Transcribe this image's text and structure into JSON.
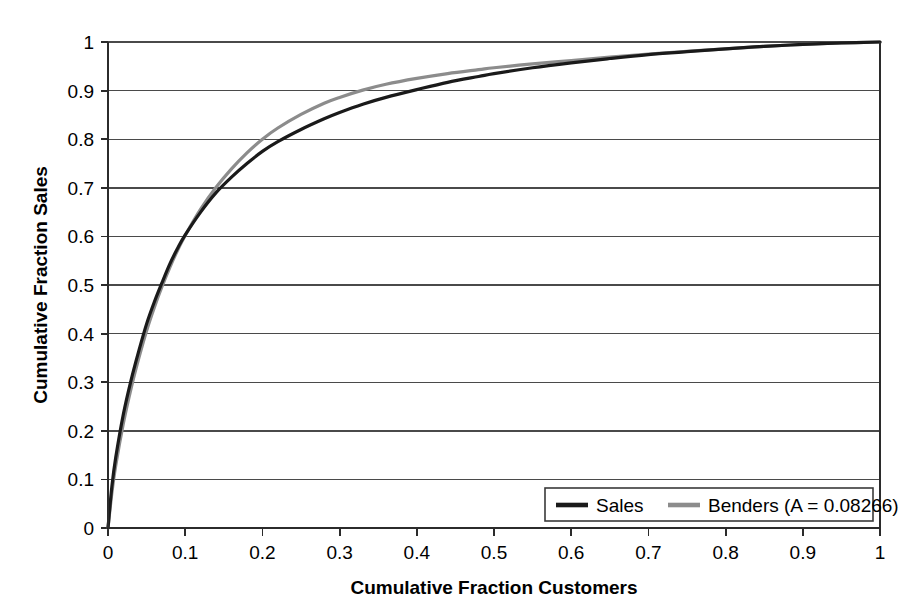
{
  "chart_data": {
    "type": "line",
    "title": "",
    "xlabel": "Cumulative Fraction Customers",
    "ylabel": "Cumulative Fraction Sales",
    "xlim": [
      0,
      1
    ],
    "ylim": [
      0,
      1
    ],
    "grid": "horizontal",
    "legend_position": "bottom-right",
    "x_ticks": [
      "0",
      "0.1",
      "0.2",
      "0.3",
      "0.4",
      "0.5",
      "0.6",
      "0.7",
      "0.8",
      "0.9",
      "1"
    ],
    "y_ticks": [
      "0",
      "0.1",
      "0.2",
      "0.3",
      "0.4",
      "0.5",
      "0.6",
      "0.7",
      "0.8",
      "0.9",
      "1"
    ],
    "x_tick_values": [
      0,
      0.1,
      0.2,
      0.3,
      0.4,
      0.5,
      0.6,
      0.7,
      0.8,
      0.9,
      1
    ],
    "y_tick_values": [
      0,
      0.1,
      0.2,
      0.3,
      0.4,
      0.5,
      0.6,
      0.7,
      0.8,
      0.9,
      1
    ],
    "series": [
      {
        "name": "Sales",
        "color": "#1a1a1a",
        "width": 3.2,
        "x": [
          0,
          0.005,
          0.01,
          0.02,
          0.03,
          0.04,
          0.05,
          0.06,
          0.07,
          0.08,
          0.09,
          0.1,
          0.12,
          0.14,
          0.16,
          0.18,
          0.2,
          0.22,
          0.25,
          0.28,
          0.3,
          0.33,
          0.36,
          0.4,
          0.44,
          0.48,
          0.5,
          0.55,
          0.6,
          0.65,
          0.7,
          0.75,
          0.8,
          0.85,
          0.9,
          0.95,
          1.0
        ],
        "y": [
          0,
          0.085,
          0.145,
          0.235,
          0.305,
          0.365,
          0.42,
          0.465,
          0.505,
          0.543,
          0.575,
          0.603,
          0.65,
          0.69,
          0.722,
          0.75,
          0.775,
          0.795,
          0.82,
          0.842,
          0.855,
          0.872,
          0.886,
          0.902,
          0.917,
          0.929,
          0.935,
          0.947,
          0.957,
          0.966,
          0.974,
          0.98,
          0.986,
          0.991,
          0.995,
          0.998,
          1.0
        ]
      },
      {
        "name": "Benders (A = 0.08266)",
        "color": "#8c8c8c",
        "width": 3.2,
        "x": [
          0,
          0.005,
          0.01,
          0.02,
          0.03,
          0.04,
          0.05,
          0.06,
          0.07,
          0.08,
          0.09,
          0.1,
          0.12,
          0.14,
          0.16,
          0.18,
          0.2,
          0.22,
          0.25,
          0.28,
          0.3,
          0.33,
          0.36,
          0.4,
          0.44,
          0.48,
          0.5,
          0.55,
          0.6,
          0.65,
          0.7,
          0.75,
          0.8,
          0.85,
          0.9,
          0.95,
          1.0
        ],
        "y": [
          0,
          0.072,
          0.128,
          0.216,
          0.288,
          0.35,
          0.406,
          0.454,
          0.497,
          0.536,
          0.571,
          0.602,
          0.656,
          0.701,
          0.739,
          0.772,
          0.8,
          0.823,
          0.851,
          0.874,
          0.886,
          0.901,
          0.913,
          0.925,
          0.935,
          0.943,
          0.947,
          0.955,
          0.962,
          0.969,
          0.975,
          0.981,
          0.986,
          0.991,
          0.995,
          0.998,
          1.0
        ]
      }
    ],
    "legend": [
      {
        "label": "Sales",
        "color": "#1a1a1a"
      },
      {
        "label": "Benders (A = 0.08266)",
        "color": "#8c8c8c"
      }
    ]
  }
}
